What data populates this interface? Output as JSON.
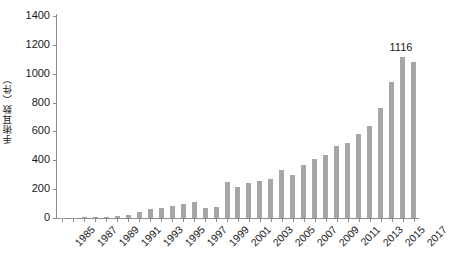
{
  "chart_data": {
    "type": "bar",
    "title": "",
    "xlabel": "",
    "ylabel": "手術耳数（件）",
    "ylim": [
      0,
      1400
    ],
    "ytick_values": [
      0,
      200,
      400,
      600,
      800,
      1000,
      1200,
      1400
    ],
    "ytick_labels": [
      "0",
      "200",
      "400",
      "600",
      "800",
      "1000",
      "1200",
      "1400"
    ],
    "grid": false,
    "legend": null,
    "bar_color": "#a6a6a6",
    "axis_color": "#8c8c8c",
    "categories": [
      "1985",
      "1986",
      "1987",
      "1988",
      "1989",
      "1990",
      "1991",
      "1992",
      "1993",
      "1994",
      "1995",
      "1996",
      "1997",
      "1998",
      "1999",
      "2000",
      "2001",
      "2002",
      "2003",
      "2004",
      "2005",
      "2006",
      "2007",
      "2008",
      "2009",
      "2010",
      "2011",
      "2012",
      "2013",
      "2014",
      "2015",
      "2016",
      "2017"
    ],
    "xtick_labels": [
      "1985",
      "1987",
      "1989",
      "1991",
      "1993",
      "1995",
      "1997",
      "1999",
      "2001",
      "2003",
      "2005",
      "2007",
      "2009",
      "2011",
      "2013",
      "2015",
      "2017"
    ],
    "values": [
      2,
      3,
      5,
      6,
      10,
      14,
      22,
      45,
      62,
      70,
      80,
      98,
      110,
      70,
      78,
      250,
      218,
      245,
      258,
      272,
      330,
      300,
      368,
      410,
      440,
      500,
      520,
      580,
      640,
      760,
      940,
      1116,
      1080
    ],
    "annotations": [
      {
        "label": "1116",
        "category": "2016",
        "value": 1116
      }
    ]
  }
}
